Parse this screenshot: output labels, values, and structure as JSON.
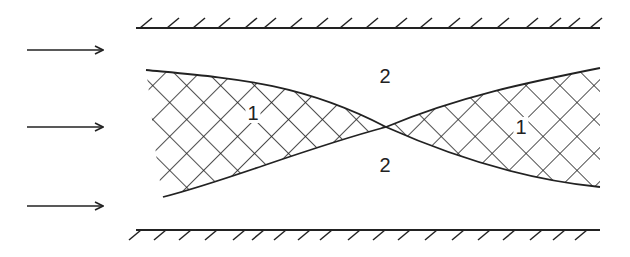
{
  "diagram": {
    "labels": {
      "region1_left": "1",
      "region1_right": "1",
      "region2_top": "2",
      "region2_bottom": "2"
    },
    "arrows": [
      {
        "name": "flow-arrow-top",
        "y": 50
      },
      {
        "name": "flow-arrow-middle",
        "y": 127
      },
      {
        "name": "flow-arrow-bottom",
        "y": 206
      }
    ],
    "walls": [
      "top-wall",
      "bottom-wall"
    ],
    "colors": {
      "line": "#222222",
      "background": "#ffffff"
    }
  }
}
